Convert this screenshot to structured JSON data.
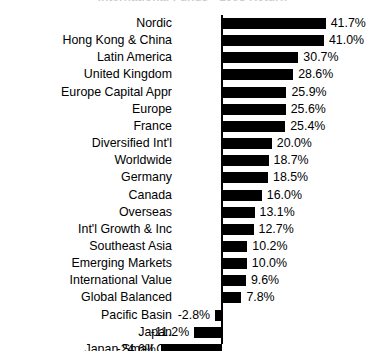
{
  "chart_data": {
    "type": "bar",
    "orientation": "horizontal",
    "title": "International Funds - 1998 Return",
    "xlabel": "",
    "ylabel": "",
    "grid": false,
    "legend": false,
    "value_suffix": "%",
    "xlim": [
      -24.6,
      41.7
    ],
    "categories": [
      "Nordic",
      "Hong Kong & China",
      "Latin America",
      "United Kingdom",
      "Europe Capital Appr",
      "Europe",
      "France",
      "Diversified Int'l",
      "Worldwide",
      "Germany",
      "Canada",
      "Overseas",
      "Int'l Growth & Inc",
      "Southeast Asia",
      "Emerging Markets",
      "International Value",
      "Global Balanced",
      "Pacific Basin",
      "Japan",
      "Japan Small Co"
    ],
    "values": [
      41.7,
      41.0,
      30.7,
      28.6,
      25.9,
      25.6,
      25.4,
      20.0,
      18.7,
      18.5,
      16.0,
      13.1,
      12.7,
      10.2,
      10.0,
      9.6,
      7.8,
      -2.8,
      -11.2,
      -24.6
    ],
    "value_labels": [
      "41.7%",
      "41.0%",
      "30.7%",
      "28.6%",
      "25.9%",
      "25.6%",
      "25.4%",
      "20.0%",
      "18.7%",
      "18.5%",
      "16.0%",
      "13.1%",
      "12.7%",
      "10.2%",
      "10.0%",
      "9.6%",
      "7.8%",
      "-2.8%",
      "-11.2%",
      "-24.6%"
    ],
    "bar_color": "#000000",
    "axis_color": "#000000",
    "background_color": "#ffffff"
  }
}
